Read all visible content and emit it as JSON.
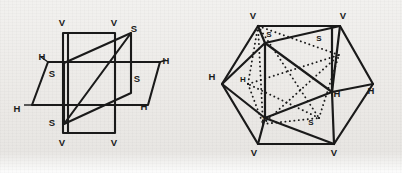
{
  "figure": {
    "background_color": "#eceae7",
    "ink_color": "#1a1a1a",
    "caption": "",
    "panels": [
      {
        "id": "left",
        "name": "three-intersecting-planes",
        "description": "Three mutually intersecting rectangular planes labelled V, H and S",
        "labels": [
          {
            "text": "V",
            "x": 62,
            "y": 26
          },
          {
            "text": "V",
            "x": 114,
            "y": 26
          },
          {
            "text": "S",
            "x": 134,
            "y": 32
          },
          {
            "text": "H",
            "x": 42,
            "y": 60
          },
          {
            "text": "H",
            "x": 162,
            "y": 64
          },
          {
            "text": "S",
            "x": 50,
            "y": 75
          },
          {
            "text": "S",
            "x": 136,
            "y": 80
          },
          {
            "text": "H",
            "x": 18,
            "y": 108
          },
          {
            "text": "H",
            "x": 143,
            "y": 107
          },
          {
            "text": "S",
            "x": 51,
            "y": 123
          },
          {
            "text": "V",
            "x": 62,
            "y": 140
          },
          {
            "text": "V",
            "x": 114,
            "y": 140
          }
        ]
      },
      {
        "id": "right",
        "name": "hexagonal-projection",
        "description": "Hexagonal outline of the same three planes seen along a body diagonal, with hidden edges dotted",
        "labels": [
          {
            "text": "V",
            "x": 52,
            "y": 17
          },
          {
            "text": "V",
            "x": 138,
            "y": 17
          },
          {
            "text": "S",
            "x": 65,
            "y": 32
          },
          {
            "text": "S",
            "x": 116,
            "y": 36
          },
          {
            "text": "H",
            "x": 11,
            "y": 76
          },
          {
            "text": "H",
            "x": 40,
            "y": 78
          },
          {
            "text": "H",
            "x": 134,
            "y": 90
          },
          {
            "text": "H",
            "x": 166,
            "y": 88
          },
          {
            "text": "S",
            "x": 62,
            "y": 117
          },
          {
            "text": "S",
            "x": 108,
            "y": 121
          },
          {
            "text": "V",
            "x": 53,
            "y": 152
          },
          {
            "text": "V",
            "x": 133,
            "y": 152
          }
        ]
      }
    ]
  }
}
